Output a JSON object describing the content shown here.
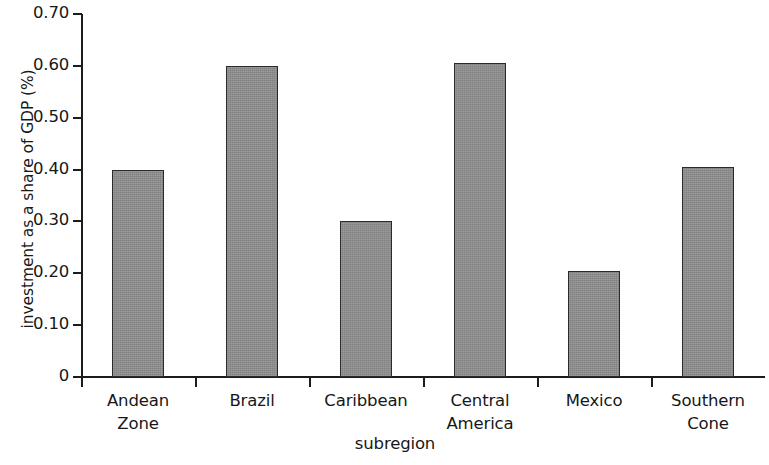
{
  "chart_data": {
    "type": "bar",
    "title": "",
    "subtitle": "",
    "xlabel": "subregion",
    "ylabel": "investment as a share of GDP (%)",
    "categories": [
      "Andean Zone",
      "Brazil",
      "Caribbean",
      "Central America",
      "Mexico",
      "Southern Cone"
    ],
    "category_lines": [
      [
        "Andean",
        "Zone"
      ],
      [
        "Brazil"
      ],
      [
        "Caribbean"
      ],
      [
        "Central",
        "America"
      ],
      [
        "Mexico"
      ],
      [
        "Southern",
        "Cone"
      ]
    ],
    "values": [
      0.4,
      0.6,
      0.3,
      0.605,
      0.205,
      0.405
    ],
    "ylim": [
      0,
      0.7
    ],
    "yticks": [
      0,
      0.1,
      0.2,
      0.3,
      0.4,
      0.5,
      0.6,
      0.7
    ],
    "ytick_labels": [
      "0",
      "0.10",
      "0.20",
      "0.30",
      "0.40",
      "0.50",
      "0.60",
      "0.70"
    ],
    "grid": false,
    "legend": null,
    "bar_color": "#8d8d8d",
    "bar_edge_color": "#2b2b2b",
    "axis_color": "#1c1c1c",
    "text_color": "#171717"
  }
}
